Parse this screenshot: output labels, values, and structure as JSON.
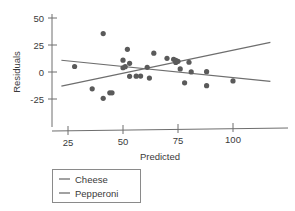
{
  "chart_data": {
    "type": "scatter",
    "title": "",
    "xlabel": "Predicted",
    "ylabel": "Residuals",
    "xlim": [
      20,
      118
    ],
    "ylim": [
      -38,
      57
    ],
    "xticks": [
      25,
      50,
      75,
      100
    ],
    "yticks": [
      -25,
      0,
      25,
      50
    ],
    "xtick_labels": [
      "25",
      "50",
      "75",
      "100"
    ],
    "ytick_labels": [
      "-25",
      "0",
      "25",
      "50"
    ],
    "grid": false,
    "legend_position": "below-left",
    "point_color": "#5a5a5a",
    "series": [
      {
        "name": "Cheese",
        "color": "#6e6e6e",
        "type": "line",
        "line": {
          "x0": 22,
          "y0": -13,
          "x1": 117,
          "y1": 24
        },
        "legend_label": "Cheese"
      },
      {
        "name": "Pepperoni",
        "color": "#6e6e6e",
        "type": "line",
        "line": {
          "x0": 22,
          "y0": 11,
          "x1": 117,
          "y1": -12
        },
        "legend_label": "Pepperoni"
      }
    ],
    "points": [
      {
        "x": 28,
        "y": 5
      },
      {
        "x": 36,
        "y": -16
      },
      {
        "x": 41,
        "y": 35
      },
      {
        "x": 41,
        "y": -25
      },
      {
        "x": 44,
        "y": -20
      },
      {
        "x": 45,
        "y": -20
      },
      {
        "x": 50,
        "y": 10
      },
      {
        "x": 50,
        "y": 3
      },
      {
        "x": 51,
        "y": 4
      },
      {
        "x": 52,
        "y": 20
      },
      {
        "x": 53,
        "y": 7
      },
      {
        "x": 53,
        "y": -5
      },
      {
        "x": 56,
        "y": -5
      },
      {
        "x": 58,
        "y": -5
      },
      {
        "x": 61,
        "y": 3
      },
      {
        "x": 62,
        "y": -7
      },
      {
        "x": 64,
        "y": 16
      },
      {
        "x": 70,
        "y": 11
      },
      {
        "x": 73,
        "y": 10
      },
      {
        "x": 74,
        "y": 9
      },
      {
        "x": 74,
        "y": 7
      },
      {
        "x": 75,
        "y": 8
      },
      {
        "x": 76,
        "y": 1
      },
      {
        "x": 78,
        "y": -12
      },
      {
        "x": 80,
        "y": 7
      },
      {
        "x": 81,
        "y": -2
      },
      {
        "x": 88,
        "y": -2
      },
      {
        "x": 88,
        "y": -15
      },
      {
        "x": 100,
        "y": -11
      }
    ]
  },
  "legend": {
    "items": [
      {
        "label": "Cheese"
      },
      {
        "label": "Pepperoni"
      }
    ]
  },
  "axes": {
    "x_title": "Predicted",
    "y_title": "Residuals"
  }
}
